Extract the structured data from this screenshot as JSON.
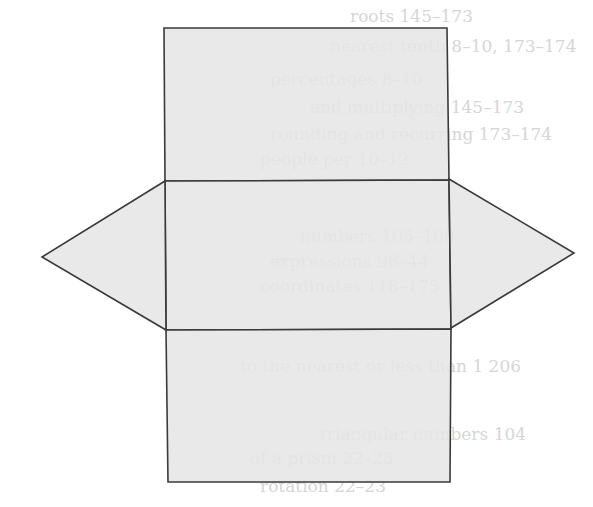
{
  "diagram": {
    "fill_color": "#e6e6e6",
    "stroke_color": "#3a3a3a",
    "background": "#ffffff",
    "faces": [
      {
        "id": "top-rectangle",
        "shape": "rect",
        "points": [
          [
            164,
            28
          ],
          [
            447,
            28
          ],
          [
            449,
            180
          ],
          [
            165,
            181
          ]
        ]
      },
      {
        "id": "middle-rectangle",
        "shape": "rect",
        "points": [
          [
            165,
            181
          ],
          [
            449,
            180
          ],
          [
            451,
            329
          ],
          [
            166,
            330
          ]
        ]
      },
      {
        "id": "bottom-rectangle",
        "shape": "rect",
        "points": [
          [
            166,
            330
          ],
          [
            451,
            329
          ],
          [
            450,
            482
          ],
          [
            168,
            482
          ]
        ]
      },
      {
        "id": "left-triangle",
        "shape": "triangle",
        "points": [
          [
            165,
            181
          ],
          [
            42,
            257
          ],
          [
            166,
            330
          ]
        ]
      },
      {
        "id": "right-triangle",
        "shape": "triangle",
        "points": [
          [
            449,
            179
          ],
          [
            574,
            253
          ],
          [
            451,
            328
          ]
        ]
      }
    ],
    "bleed_through_text": [
      {
        "text": "roots 145–173",
        "x": 350,
        "y": 20
      },
      {
        "text": "nearest tenth  8–10, 173–174",
        "x": 330,
        "y": 50
      },
      {
        "text": "percentages  8–10",
        "x": 270,
        "y": 83
      },
      {
        "text": "and multiplying  145–173",
        "x": 310,
        "y": 111
      },
      {
        "text": "rounding and recurring  173–174",
        "x": 270,
        "y": 138
      },
      {
        "text": "people per  10–12",
        "x": 260,
        "y": 163
      },
      {
        "text": "numbers  105–108",
        "x": 300,
        "y": 240
      },
      {
        "text": "expressions  96–44",
        "x": 270,
        "y": 265
      },
      {
        "text": "coordinates  118–175",
        "x": 260,
        "y": 290
      },
      {
        "text": "to the nearest or less than 1  206",
        "x": 240,
        "y": 370
      },
      {
        "text": "triangular numbers  104",
        "x": 320,
        "y": 438
      },
      {
        "text": "of a prism  22–23",
        "x": 250,
        "y": 462
      },
      {
        "text": "rotation  22–23",
        "x": 260,
        "y": 490
      }
    ]
  }
}
